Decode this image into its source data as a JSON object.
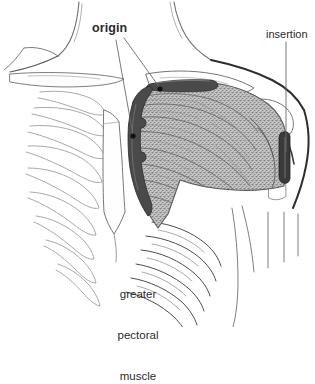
{
  "figure": {
    "type": "anatomical-illustration",
    "background_color": "#ffffff"
  },
  "labels": {
    "origin": "origin",
    "insertion": "insertion",
    "muscle_line1": "greater",
    "muscle_line2": "pectoral",
    "muscle_line3": "muscle"
  },
  "colors": {
    "line": "#3b3b3b",
    "thin_line": "#8d8d8d",
    "bone_line": "#6f6f6f",
    "attachment_dark": "#4a4a4a",
    "attachment_darker": "#3a3a3a",
    "muscle_fill": "#b9b9b9",
    "muscle_fiber": "#7a7a7a",
    "text": "#2b2b2b",
    "marker_dot": "#111111",
    "leader_line": "#6a6a6a"
  },
  "annotations": [
    {
      "name": "origin",
      "label": "origin",
      "description": "clavicular and sternocostal origin of the greater pectoral muscle",
      "marker_points": [
        {
          "x": 160,
          "y": 89
        },
        {
          "x": 133,
          "y": 136
        }
      ],
      "leader_from": {
        "x": 118,
        "y": 40
      }
    },
    {
      "name": "insertion",
      "label": "insertion",
      "description": "insertion on the humerus",
      "marker_points": [
        {
          "x": 285,
          "y": 152
        }
      ],
      "leader_from": {
        "x": 286,
        "y": 42
      }
    },
    {
      "name": "greater-pectoral-muscle",
      "label": "greater pectoral muscle",
      "description": "shaded stippled muscle belly spanning sternum to humerus"
    }
  ]
}
